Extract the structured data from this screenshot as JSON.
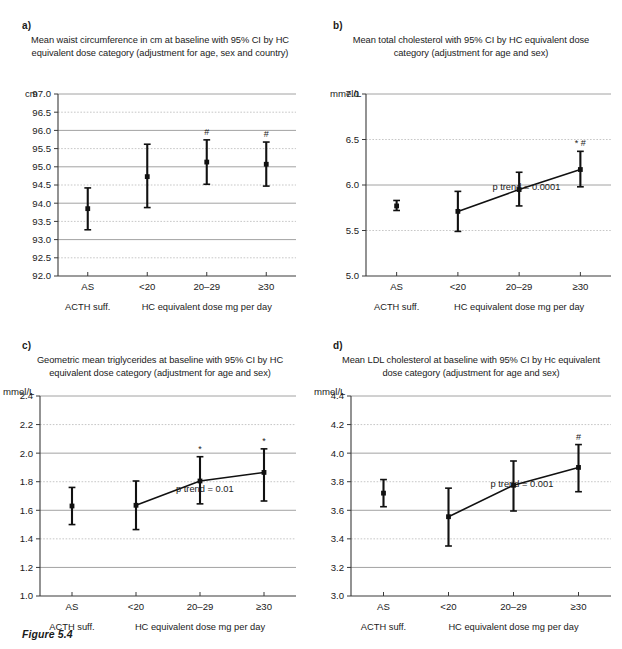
{
  "figure": {
    "caption": "Figure 5.4"
  },
  "chart_data": [
    {
      "id": "a",
      "panel_letter": "a)",
      "type": "scatter",
      "title": "Mean waist circumference in cm at baseline with 95% CI by HC equivalent dose category (adjustment for age, sex and country)",
      "ylabel": "cm",
      "xlabel": "",
      "ylim": [
        92.0,
        97.0
      ],
      "ystep": 0.5,
      "ytick_labels": [
        "92.0",
        "92.5",
        "93.0",
        "93.5",
        "94.0",
        "94.5",
        "95.0",
        "95.5",
        "96.0",
        "96.5",
        "97.0"
      ],
      "categories": [
        "AS",
        "<20",
        "20–29",
        "≥30"
      ],
      "group_labels": [
        "ACTH suff.",
        "HC equivalent dose mg per day"
      ],
      "grid": true,
      "trendline": false,
      "trendline_from": null,
      "p_trend": "",
      "points": [
        {
          "category": "AS",
          "value": 93.85,
          "ci_low": 93.27,
          "ci_high": 94.42,
          "sig": ""
        },
        {
          "category": "<20",
          "value": 94.73,
          "ci_low": 93.88,
          "ci_high": 95.62,
          "sig": ""
        },
        {
          "category": "20–29",
          "value": 95.13,
          "ci_low": 94.52,
          "ci_high": 95.74,
          "sig": "#"
        },
        {
          "category": "≥30",
          "value": 95.07,
          "ci_low": 94.47,
          "ci_high": 95.68,
          "sig": "#"
        }
      ]
    },
    {
      "id": "b",
      "panel_letter": "b)",
      "type": "scatter",
      "title": "Mean total cholesterol with 95% CI by HC equivalent dose category (adjustment for age and sex)",
      "ylabel": "mmel/L",
      "xlabel": "",
      "ylim": [
        5.0,
        7.0
      ],
      "ystep": 0.5,
      "ytick_labels": [
        "5.0",
        "5.5",
        "6.0",
        "6.5",
        "7.0"
      ],
      "categories": [
        "AS",
        "<20",
        "20–29",
        "≥30"
      ],
      "group_labels": [
        "ACTH suff.",
        "HC equivalent dose mg per day"
      ],
      "grid": true,
      "trendline": true,
      "trendline_from": 1,
      "p_trend": "p trend = 0.0001",
      "points": [
        {
          "category": "AS",
          "value": 5.77,
          "ci_low": 5.72,
          "ci_high": 5.83,
          "sig": ""
        },
        {
          "category": "<20",
          "value": 5.71,
          "ci_low": 5.49,
          "ci_high": 5.93,
          "sig": ""
        },
        {
          "category": "20–29",
          "value": 5.95,
          "ci_low": 5.77,
          "ci_high": 6.14,
          "sig": ""
        },
        {
          "category": "≥30",
          "value": 6.17,
          "ci_low": 5.98,
          "ci_high": 6.37,
          "sig": "* #"
        }
      ]
    },
    {
      "id": "c",
      "panel_letter": "c)",
      "type": "scatter",
      "title": "Geometric mean triglycerides at baseline with 95% CI by HC equivalent dose category (adjustment for age and sex)",
      "ylabel": "mmel/L",
      "xlabel": "",
      "ylim": [
        1.0,
        2.4
      ],
      "ystep": 0.2,
      "ytick_labels": [
        "1.0",
        "1.2",
        "1.4",
        "1.6",
        "1.8",
        "2.0",
        "2.2",
        "2.4"
      ],
      "categories": [
        "AS",
        "<20",
        "20–29",
        "≥30"
      ],
      "group_labels": [
        "ACTH suff.",
        "HC equivalent dose mg per day"
      ],
      "grid": true,
      "trendline": true,
      "trendline_from": 1,
      "p_trend": "p trend = 0.01",
      "points": [
        {
          "category": "AS",
          "value": 1.63,
          "ci_low": 1.5,
          "ci_high": 1.76,
          "sig": ""
        },
        {
          "category": "<20",
          "value": 1.635,
          "ci_low": 1.465,
          "ci_high": 1.805,
          "sig": ""
        },
        {
          "category": "20–29",
          "value": 1.805,
          "ci_low": 1.645,
          "ci_high": 1.975,
          "sig": "*"
        },
        {
          "category": "≥30",
          "value": 1.865,
          "ci_low": 1.665,
          "ci_high": 2.03,
          "sig": "*"
        }
      ]
    },
    {
      "id": "d",
      "panel_letter": "d)",
      "type": "scatter",
      "title": "Mean LDL cholesterol at baseline with 95% CI by Hc equivalent dose category (adjustment for age and sex)",
      "ylabel": "mmel/L",
      "xlabel": "",
      "ylim": [
        3.0,
        4.4
      ],
      "ystep": 0.2,
      "ytick_labels": [
        "3.0",
        "3.2",
        "3.4",
        "3.6",
        "3.8",
        "4.0",
        "4.2",
        "4.4"
      ],
      "categories": [
        "AS",
        "<20",
        "20–29",
        "≥30"
      ],
      "group_labels": [
        "ACTH suff.",
        "HC equivalent dose mg per day"
      ],
      "grid": true,
      "trendline": true,
      "trendline_from": 1,
      "p_trend": "p trend = 0.001",
      "points": [
        {
          "category": "AS",
          "value": 3.72,
          "ci_low": 3.625,
          "ci_high": 3.815,
          "sig": ""
        },
        {
          "category": "<20",
          "value": 3.555,
          "ci_low": 3.35,
          "ci_high": 3.755,
          "sig": ""
        },
        {
          "category": "20–29",
          "value": 3.775,
          "ci_low": 3.595,
          "ci_high": 3.945,
          "sig": ""
        },
        {
          "category": "≥30",
          "value": 3.9,
          "ci_low": 3.73,
          "ci_high": 4.06,
          "sig": "#"
        }
      ]
    }
  ]
}
